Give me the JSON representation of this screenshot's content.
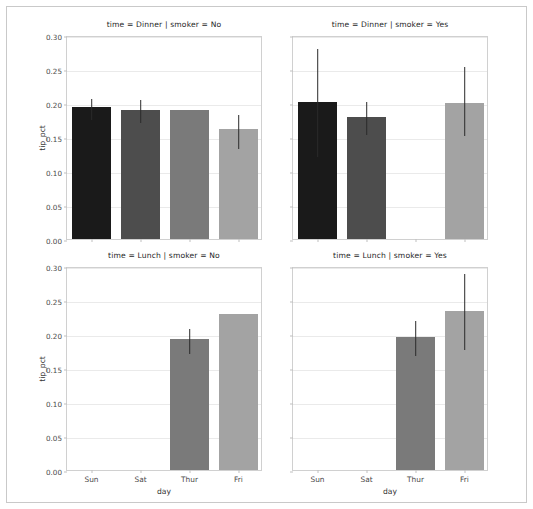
{
  "chart_data": {
    "type": "bar",
    "title": "",
    "xlabel": "day",
    "ylabel": "tip_pct",
    "categories": [
      "Sun",
      "Sat",
      "Thur",
      "Fri"
    ],
    "ylim": [
      0.0,
      0.3
    ],
    "yticks": [
      "0.00",
      "0.05",
      "0.10",
      "0.15",
      "0.20",
      "0.25",
      "0.30"
    ],
    "ytick_values": [
      0.0,
      0.05,
      0.1,
      0.15,
      0.2,
      0.25,
      0.3
    ],
    "grid": true,
    "legend": "none",
    "facet_rows": [
      "Dinner",
      "Lunch"
    ],
    "facet_cols": [
      "No",
      "Yes"
    ],
    "palette": [
      "#1a1a1a",
      "#4d4d4d",
      "#7a7a7a",
      "#a3a3a3"
    ],
    "panels": [
      {
        "title": "time = Dinner | smoker = No",
        "time": "Dinner",
        "smoker": "No",
        "values": [
          0.194,
          0.19,
          0.19,
          0.162
        ],
        "err_low": [
          0.178,
          0.174,
          null,
          0.136
        ],
        "err_high": [
          0.209,
          0.207,
          null,
          0.185
        ]
      },
      {
        "title": "time = Dinner | smoker = Yes",
        "time": "Dinner",
        "smoker": "Yes",
        "values": [
          0.202,
          0.18,
          null,
          0.2
        ],
        "err_low": [
          0.124,
          0.156,
          null,
          0.155
        ],
        "err_high": [
          0.283,
          0.205,
          null,
          0.256
        ]
      },
      {
        "title": "time = Lunch | smoker = No",
        "time": "Lunch",
        "smoker": "No",
        "values": [
          null,
          null,
          0.192,
          0.229
        ],
        "err_low": [
          null,
          null,
          0.174,
          null
        ],
        "err_high": [
          null,
          null,
          0.21,
          null
        ]
      },
      {
        "title": "time = Lunch | smoker = Yes",
        "time": "Lunch",
        "smoker": "Yes",
        "values": [
          null,
          null,
          0.196,
          0.234
        ],
        "err_low": [
          null,
          null,
          0.17,
          0.179
        ],
        "err_high": [
          null,
          null,
          0.222,
          0.291
        ]
      }
    ]
  }
}
